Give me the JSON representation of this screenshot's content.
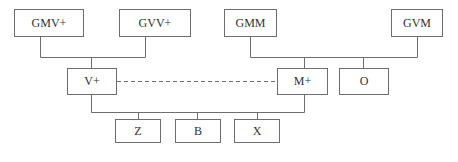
{
  "diagram": {
    "type": "family-tree",
    "line_color": "#6e6e6e",
    "nodes": {
      "gmv_plus": "GMV+",
      "gvv_plus": "GVV+",
      "gmm": "GMM",
      "gvm": "GVM",
      "v_plus": "V+",
      "m_plus": "M+",
      "o": "O",
      "z": "Z",
      "b": "B",
      "x": "X"
    },
    "edges": [
      {
        "from": [
          "GMV+",
          "GVV+"
        ],
        "to": "V+",
        "style": "solid"
      },
      {
        "from": [
          "GMM",
          "GVM"
        ],
        "to": [
          "M+",
          "O"
        ],
        "style": "solid"
      },
      {
        "from": "V+",
        "to": "M+",
        "style": "dashed"
      },
      {
        "from": [
          "V+",
          "M+"
        ],
        "to": [
          "Z",
          "B",
          "X"
        ],
        "style": "solid"
      }
    ]
  }
}
